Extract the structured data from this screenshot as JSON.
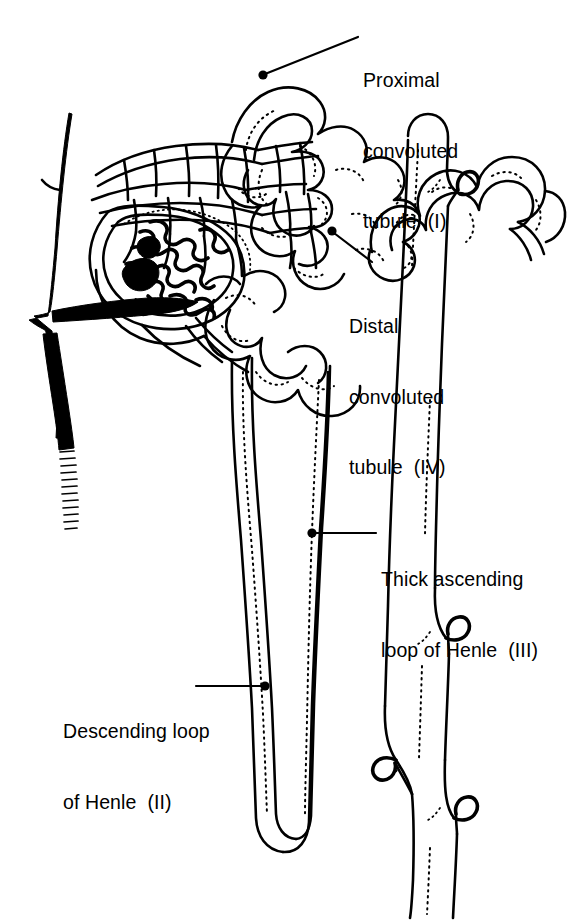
{
  "figure": {
    "background_color": "#ffffff",
    "ink_color": "#000000",
    "width": 576,
    "height": 921
  },
  "labels": {
    "proximal": {
      "line1": "Proximal",
      "line2": "convoluted",
      "line3": "tubule  (I)",
      "full": "Proximal convoluted tubule (I)",
      "numeral": "I"
    },
    "distal": {
      "line1": "Distal",
      "line2": "convoluted",
      "line3": "tubule  (IV)",
      "full": "Distal convoluted tubule (IV)",
      "numeral": "IV"
    },
    "thick_ascending": {
      "line1": "Thick ascending",
      "line2": "loop of Henle  (III)",
      "full": "Thick ascending loop of Henle (III)",
      "numeral": "III"
    },
    "descending": {
      "line1": "Descending loop",
      "line2": "of Henle  (II)",
      "full": "Descending loop of Henle (II)",
      "numeral": "II"
    }
  },
  "structures": {
    "arteriole": "renal-arteriole",
    "glomerulus": "glomerular-capillary-tuft",
    "bowmans_capsule": "bowmans-capsule",
    "peritubular_capillaries": "peritubular-capillary-network",
    "proximal_tubule": "proximal-convoluted-tubule",
    "descending_limb": "descending-loop-of-henle",
    "ascending_limb": "thick-ascending-loop-of-henle",
    "distal_tubule": "distal-convoluted-tubule",
    "collecting_duct": "collecting-duct"
  }
}
